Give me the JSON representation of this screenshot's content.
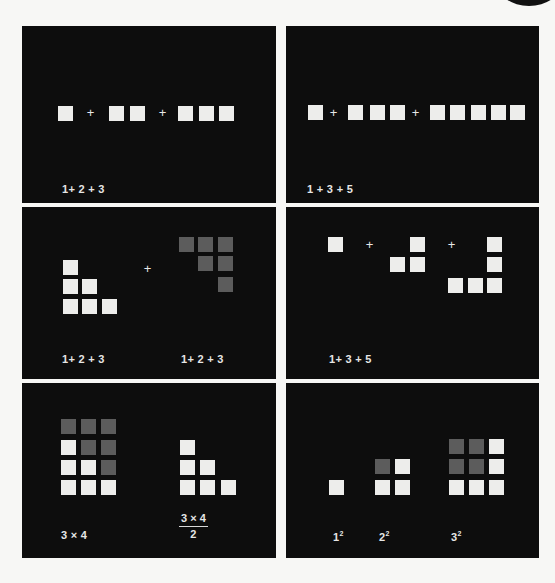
{
  "figure": {
    "colors": {
      "background": "#0d0d0d",
      "square_light": "#ededeb",
      "square_dark": "#5c5c5c",
      "page": "#f7f7f5"
    },
    "panels": [
      {
        "id": "top-left",
        "box": [
          22,
          26,
          254,
          177
        ],
        "squares": [
          [
            36,
            80,
            "light"
          ],
          [
            87,
            80,
            "light"
          ],
          [
            108,
            80,
            "light"
          ],
          [
            156,
            80,
            "light"
          ],
          [
            177,
            80,
            "light"
          ],
          [
            197,
            80,
            "light"
          ]
        ],
        "pluses": [
          [
            63,
            80
          ],
          [
            135,
            80
          ]
        ],
        "labels": [
          {
            "text": "1+ 2 + 3",
            "x": 40,
            "y": 157
          }
        ]
      },
      {
        "id": "top-right",
        "box": [
          286,
          26,
          253,
          177
        ],
        "squares": [
          [
            22,
            79,
            "light"
          ],
          [
            62,
            79,
            "light"
          ],
          [
            84,
            79,
            "light"
          ],
          [
            104,
            79,
            "light"
          ],
          [
            144,
            79,
            "light"
          ],
          [
            164,
            79,
            "light"
          ],
          [
            185,
            79,
            "light"
          ],
          [
            205,
            79,
            "light"
          ],
          [
            224,
            79,
            "light"
          ]
        ],
        "pluses": [
          [
            42,
            80
          ],
          [
            124,
            80
          ]
        ],
        "labels": [
          {
            "text": "1 + 3 + 5",
            "x": 21,
            "y": 157
          }
        ]
      },
      {
        "id": "middle-left",
        "box": [
          22,
          207,
          254,
          172
        ],
        "squares": [
          [
            41,
            53,
            "light"
          ],
          [
            41,
            72,
            "light"
          ],
          [
            60,
            72,
            "light"
          ],
          [
            41,
            92,
            "light"
          ],
          [
            60,
            92,
            "light"
          ],
          [
            80,
            92,
            "light"
          ],
          [
            157,
            30,
            "dark"
          ],
          [
            176,
            30,
            "dark"
          ],
          [
            196,
            30,
            "dark"
          ],
          [
            176,
            49,
            "dark"
          ],
          [
            196,
            49,
            "dark"
          ],
          [
            196,
            70,
            "dark"
          ]
        ],
        "pluses": [
          [
            120,
            55
          ]
        ],
        "labels": [
          {
            "text": "1+ 2 + 3",
            "x": 40,
            "y": 146
          },
          {
            "text": "1+ 2 + 3",
            "x": 159,
            "y": 146
          }
        ]
      },
      {
        "id": "middle-right",
        "box": [
          286,
          207,
          253,
          172
        ],
        "squares": [
          [
            42,
            30,
            "light"
          ],
          [
            124,
            30,
            "light"
          ],
          [
            104,
            50,
            "light"
          ],
          [
            124,
            50,
            "light"
          ],
          [
            201,
            30,
            "light"
          ],
          [
            201,
            50,
            "light"
          ],
          [
            162,
            71,
            "light"
          ],
          [
            182,
            71,
            "light"
          ],
          [
            201,
            71,
            "light"
          ]
        ],
        "pluses": [
          [
            78,
            31
          ],
          [
            160,
            31
          ]
        ],
        "labels": [
          {
            "text": "1+ 3 + 5",
            "x": 43,
            "y": 146
          }
        ]
      },
      {
        "id": "bottom-left",
        "box": [
          22,
          383,
          254,
          175
        ],
        "squares": [
          [
            39,
            36,
            "dark"
          ],
          [
            59,
            36,
            "dark"
          ],
          [
            79,
            36,
            "dark"
          ],
          [
            39,
            57,
            "light"
          ],
          [
            59,
            57,
            "dark"
          ],
          [
            79,
            57,
            "dark"
          ],
          [
            39,
            77,
            "light"
          ],
          [
            59,
            77,
            "light"
          ],
          [
            79,
            77,
            "dark"
          ],
          [
            39,
            97,
            "light"
          ],
          [
            59,
            97,
            "light"
          ],
          [
            79,
            97,
            "light"
          ],
          [
            158,
            57,
            "light"
          ],
          [
            158,
            77,
            "light"
          ],
          [
            178,
            77,
            "light"
          ],
          [
            158,
            97,
            "light"
          ],
          [
            178,
            97,
            "light"
          ],
          [
            199,
            97,
            "light"
          ]
        ],
        "pluses": [],
        "labels": [
          {
            "text": "3 × 4",
            "x": 39,
            "y": 146
          }
        ],
        "fraction": {
          "numerator": "3 × 4",
          "denominator": "2",
          "x": 157,
          "y": 129
        }
      },
      {
        "id": "bottom-right",
        "box": [
          286,
          383,
          253,
          175
        ],
        "squares": [
          [
            43,
            97,
            "light"
          ],
          [
            89,
            76,
            "dark"
          ],
          [
            109,
            76,
            "light"
          ],
          [
            89,
            97,
            "light"
          ],
          [
            109,
            97,
            "light"
          ],
          [
            163,
            56,
            "dark"
          ],
          [
            183,
            56,
            "dark"
          ],
          [
            203,
            56,
            "light"
          ],
          [
            163,
            76,
            "dark"
          ],
          [
            183,
            76,
            "dark"
          ],
          [
            203,
            76,
            "light"
          ],
          [
            163,
            97,
            "light"
          ],
          [
            183,
            97,
            "light"
          ],
          [
            203,
            97,
            "light"
          ]
        ],
        "pluses": [],
        "labels": [
          {
            "base": "1",
            "exp": "2",
            "x": 47,
            "y": 147
          },
          {
            "base": "2",
            "exp": "2",
            "x": 93,
            "y": 147
          },
          {
            "base": "3",
            "exp": "2",
            "x": 165,
            "y": 147
          }
        ]
      }
    ]
  },
  "plus_glyph": "+"
}
